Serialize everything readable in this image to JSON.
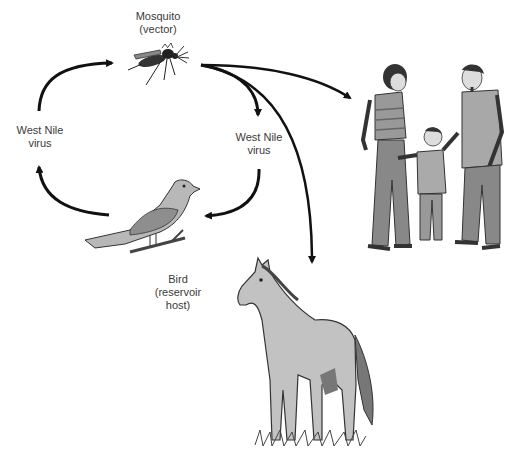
{
  "diagram": {
    "nodes": {
      "mosquito": {
        "line1": "Mosquito",
        "line2": "(vector)"
      },
      "bird": {
        "line1": "Bird",
        "line2": "(reservoir",
        "line3": "host)"
      },
      "humans": {
        "description": "people (incidental hosts)"
      },
      "horse": {
        "description": "horse (incidental host)"
      }
    },
    "edges": {
      "left": {
        "line1": "West Nile",
        "line2": "virus"
      },
      "right": {
        "line1": "West Nile",
        "line2": "virus"
      }
    },
    "colors": {
      "background": "#ffffff",
      "arrow": "#111111",
      "text": "#3a3a3a",
      "fill_gray": "#b8b8b8",
      "fill_dark": "#555555"
    }
  }
}
